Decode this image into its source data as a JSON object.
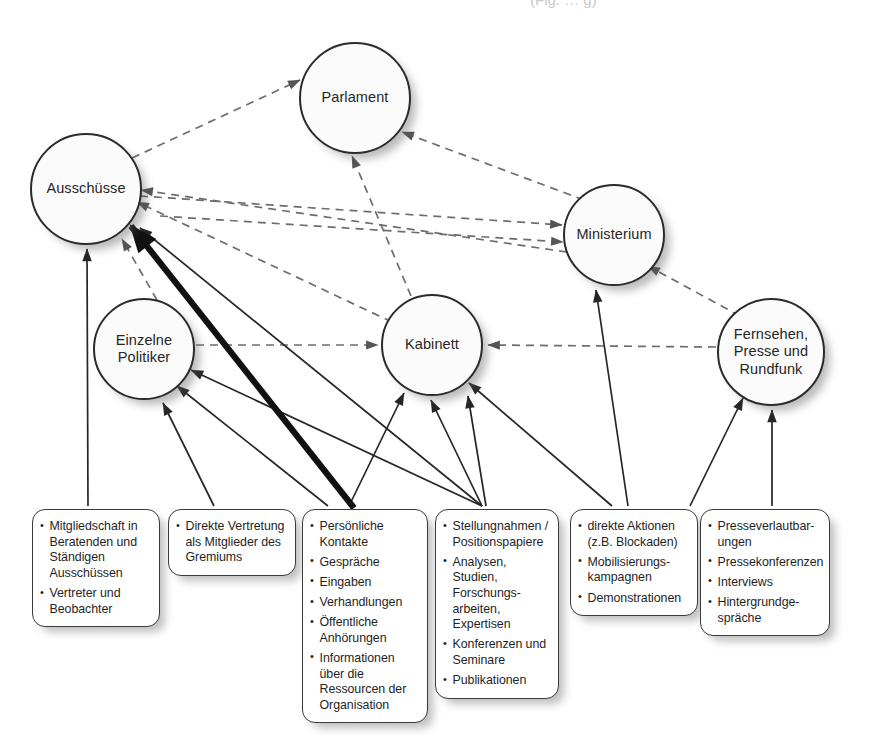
{
  "figure": {
    "top_caption_fragment": "(Fig.  …  g)",
    "kind": "influence-diagram",
    "legend_note": ""
  },
  "nodes": [
    {
      "id": "parlament",
      "label": "Parlament",
      "cx": 355,
      "cy": 98,
      "r": 56
    },
    {
      "id": "ausschuesse",
      "label": "Ausschüsse",
      "cx": 86,
      "cy": 189,
      "r": 56
    },
    {
      "id": "ministerium",
      "label": "Ministerium",
      "cx": 614,
      "cy": 235,
      "r": 51
    },
    {
      "id": "politiker",
      "label": "Einzelne\nPolitiker",
      "cx": 144,
      "cy": 349,
      "r": 51
    },
    {
      "id": "kabinett",
      "label": "Kabinett",
      "cx": 432,
      "cy": 345,
      "r": 51
    },
    {
      "id": "medien",
      "label": "Fernsehen,\nPresse und\nRundfunk",
      "cx": 771,
      "cy": 352,
      "r": 54
    }
  ],
  "boxes": [
    {
      "id": "box-mitgliedschaft",
      "x": 32,
      "y": 509,
      "w": 128,
      "h": 106,
      "items": [
        "Mitgliedschaft in Beratenden und Ständigen Ausschüssen",
        "Vertreter und Beobachter"
      ]
    },
    {
      "id": "box-direkte-vertretung",
      "x": 168,
      "y": 509,
      "w": 128,
      "h": 78,
      "items": [
        "Direkte Vertretung als Mitglieder des Gremiums"
      ]
    },
    {
      "id": "box-kontakte",
      "x": 302,
      "y": 509,
      "w": 126,
      "h": 190,
      "items": [
        "Persönliche Kontakte",
        "Gespräche",
        "Eingaben",
        "Verhandlungen",
        "Öffentliche Anhörungen",
        "Informationen über die Ressourcen der Organisation"
      ]
    },
    {
      "id": "box-stellungnahmen",
      "x": 435,
      "y": 509,
      "w": 124,
      "h": 172,
      "items": [
        "Stellungnahmen / Positionspapiere",
        "Analysen, Studien, Forschungs-arbeiten, Expertisen",
        "Konferenzen und Seminare",
        "Publikationen"
      ]
    },
    {
      "id": "box-aktionen",
      "x": 570,
      "y": 509,
      "w": 128,
      "h": 110,
      "items": [
        "direkte Aktionen (z.B. Blockaden)",
        "Mobilisierungs-kampagnen",
        "Demonstrationen"
      ]
    },
    {
      "id": "box-presse",
      "x": 700,
      "y": 509,
      "w": 130,
      "h": 118,
      "items": [
        "Presseverlautbar-ungen",
        "Pressekonferenzen",
        "Interviews",
        "Hintergrundge-spräche"
      ]
    }
  ],
  "edges_dashed": [
    {
      "from": "ausschuesse",
      "to": "parlament"
    },
    {
      "from": "ausschuesse",
      "to": "ministerium"
    },
    {
      "from": "kabinett",
      "to": "ausschuesse"
    },
    {
      "from": "ministerium",
      "to": "ausschuesse"
    },
    {
      "from": "kabinett",
      "to": "parlament"
    },
    {
      "from": "ministerium",
      "to": "parlament"
    },
    {
      "from": "politiker",
      "to": "kabinett"
    },
    {
      "from": "medien",
      "to": "kabinett"
    },
    {
      "from": "medien",
      "to": "ministerium"
    },
    {
      "from": "kabinett",
      "to": "ministerium"
    },
    {
      "from": "politiker",
      "to": "ausschuesse"
    }
  ],
  "edges_solid": [
    {
      "from": "box-mitgliedschaft",
      "to": "ausschuesse",
      "weight": "thin"
    },
    {
      "from": "box-direkte-vertretung",
      "to": "politiker",
      "weight": "thin"
    },
    {
      "from": "box-kontakte",
      "to": "ausschuesse",
      "weight": "thick"
    },
    {
      "from": "box-kontakte",
      "to": "politiker",
      "weight": "thin"
    },
    {
      "from": "box-kontakte",
      "to": "kabinett",
      "weight": "thin"
    },
    {
      "from": "box-stellungnahmen",
      "to": "ausschuesse",
      "weight": "thin"
    },
    {
      "from": "box-stellungnahmen",
      "to": "politiker",
      "weight": "thin"
    },
    {
      "from": "box-stellungnahmen",
      "to": "kabinett",
      "weight": "thin"
    },
    {
      "from": "box-stellungnahmen",
      "to": "ministerium",
      "weight": "thin"
    },
    {
      "from": "box-aktionen",
      "to": "kabinett",
      "weight": "thin"
    },
    {
      "from": "box-aktionen",
      "to": "medien",
      "weight": "thin"
    },
    {
      "from": "box-presse",
      "to": "medien",
      "weight": "thin"
    }
  ],
  "colors": {
    "stroke": "#2b2b2b",
    "dashed_stroke": "#6d6d6d",
    "node_fill": "#fbfbfb",
    "box_fill": "#ffffff",
    "shadow": "#9a9a9a",
    "text": "#1f1f1f"
  }
}
